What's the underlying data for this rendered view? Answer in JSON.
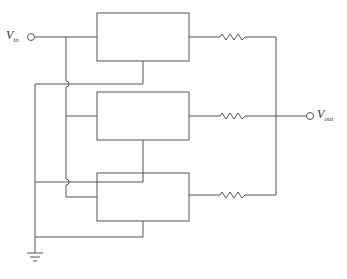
{
  "diagram": {
    "type": "circuit-schematic",
    "input_label": {
      "main": "V",
      "sub": "in"
    },
    "output_label": {
      "main": "V",
      "sub": "out"
    },
    "stages": [
      {
        "name": "block-1",
        "resistor": "R1"
      },
      {
        "name": "block-2",
        "resistor": "R2"
      },
      {
        "name": "block-3",
        "resistor": "R3"
      }
    ],
    "line_color": "#555555"
  }
}
